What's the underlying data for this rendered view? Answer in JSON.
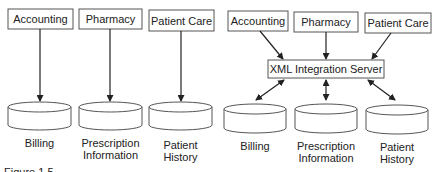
{
  "left_diagram": {
    "apps": [
      {
        "label": "Accounting"
      },
      {
        "label": "Pharmacy"
      },
      {
        "label": "Patient Care"
      }
    ],
    "databases": [
      {
        "line1": "Billing",
        "line2": ""
      },
      {
        "line1": "Prescription",
        "line2": "Information"
      },
      {
        "line1": "Patient",
        "line2": "History"
      }
    ]
  },
  "right_diagram": {
    "apps": [
      {
        "label": "Accounting"
      },
      {
        "label": "Pharmacy"
      },
      {
        "label": "Patient Care"
      }
    ],
    "server": {
      "label": "XML Integration Server"
    },
    "databases": [
      {
        "line1": "Billing",
        "line2": ""
      },
      {
        "line1": "Prescription",
        "line2": "Information"
      },
      {
        "line1": "Patient",
        "line2": "History"
      }
    ]
  },
  "caption_fragment": "Figure 1.5"
}
